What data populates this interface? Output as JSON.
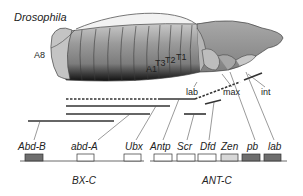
{
  "title": "Drosophila",
  "embryo": {
    "segments": [
      {
        "label": "A8",
        "x": 34,
        "y": 58
      },
      {
        "label": "A1",
        "x": 146,
        "y": 72
      },
      {
        "label": "T3",
        "x": 155,
        "y": 66
      },
      {
        "label": "T2",
        "x": 165,
        "y": 63
      },
      {
        "label": "T1",
        "x": 176,
        "y": 60
      }
    ],
    "head_labels": [
      {
        "label": "lab",
        "x": 188,
        "y": 95
      },
      {
        "label": "max",
        "x": 223,
        "y": 95
      },
      {
        "label": "int",
        "x": 260,
        "y": 95
      }
    ]
  },
  "genes": [
    {
      "name": "Abd-B",
      "x": 18,
      "fill": "#6e6e6e"
    },
    {
      "name": "abd-A",
      "x": 71,
      "fill": "#ffffff"
    },
    {
      "name": "Ubx",
      "x": 119,
      "fill": "#ffffff"
    },
    {
      "name": "Antp",
      "x": 150,
      "fill": "#ffffff"
    },
    {
      "name": "Scr",
      "x": 177,
      "fill": "#ffffff"
    },
    {
      "name": "Dfd",
      "x": 199,
      "fill": "#ffffff"
    },
    {
      "name": "Zen",
      "x": 221,
      "fill": "#d8d8d8"
    },
    {
      "name": "pb",
      "x": 245,
      "fill": "#6e6e6e"
    },
    {
      "name": "lab",
      "x": 266,
      "fill": "#6e6e6e"
    }
  ],
  "complexes": [
    {
      "name": "BX-C",
      "x": 88,
      "y": 182
    },
    {
      "name": "ANT-C",
      "x": 218,
      "y": 182
    }
  ],
  "colors": {
    "body_dark": "#7a7a7a",
    "body_light": "#bdbdbd",
    "head": "#9a9a9a",
    "line": "#333333"
  }
}
